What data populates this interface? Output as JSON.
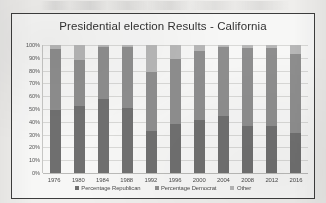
{
  "scan": {
    "artifact_name": "scanned-text-smudge"
  },
  "chart_data": {
    "type": "bar",
    "stacked": true,
    "stack_mode": "percent",
    "title": "Presidential election Results - California",
    "xlabel": "",
    "ylabel": "",
    "ylim": [
      0,
      100
    ],
    "grid": true,
    "legend_position": "bottom",
    "categories": [
      "1976",
      "1980",
      "1984",
      "1988",
      "1992",
      "1996",
      "2000",
      "2004",
      "2008",
      "2012",
      "2016"
    ],
    "ytick_labels": [
      "100%",
      "90%",
      "80%",
      "70%",
      "60%",
      "50%",
      "40%",
      "30%",
      "20%",
      "10%",
      "0%"
    ],
    "ytick_values": [
      100,
      90,
      80,
      70,
      60,
      50,
      40,
      30,
      20,
      10,
      0
    ],
    "series": [
      {
        "name": "Percentage Republican",
        "color": "#6f6f6f",
        "values": [
          49.3,
          52.7,
          57.5,
          51.1,
          32.6,
          38.2,
          41.7,
          44.4,
          37.0,
          37.1,
          31.6
        ]
      },
      {
        "name": "Percentage Democrat",
        "color": "#8e8e8e",
        "values": [
          47.6,
          35.9,
          41.3,
          47.6,
          46.0,
          51.1,
          53.4,
          54.3,
          61.0,
          60.2,
          61.7
        ]
      },
      {
        "name": "Other",
        "color": "#b9b9b9",
        "values": [
          3.1,
          11.4,
          1.2,
          1.3,
          21.4,
          10.7,
          4.9,
          1.3,
          2.0,
          2.7,
          6.7
        ]
      }
    ]
  }
}
